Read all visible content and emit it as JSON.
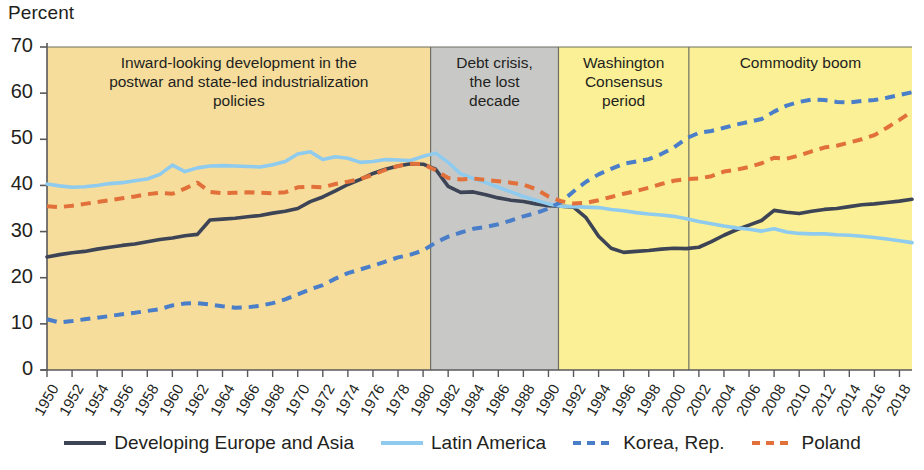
{
  "chart_data": {
    "type": "line",
    "title": "",
    "ylabel": "Percent",
    "xlabel": "",
    "ylim": [
      0,
      70
    ],
    "ytick_step": 10,
    "yticks": [
      0,
      10,
      20,
      30,
      40,
      50,
      60,
      70
    ],
    "xlim": [
      1950,
      2019
    ],
    "xticks": [
      1950,
      1952,
      1954,
      1956,
      1958,
      1960,
      1962,
      1964,
      1966,
      1968,
      1970,
      1972,
      1974,
      1976,
      1978,
      1980,
      1982,
      1984,
      1986,
      1988,
      1990,
      1992,
      1994,
      1996,
      1998,
      2000,
      2002,
      2004,
      2006,
      2008,
      2010,
      2012,
      2014,
      2016,
      2018
    ],
    "grid": false,
    "legend_position": "bottom",
    "x": [
      1950,
      1951,
      1952,
      1953,
      1954,
      1955,
      1956,
      1957,
      1958,
      1959,
      1960,
      1961,
      1962,
      1963,
      1964,
      1965,
      1966,
      1967,
      1968,
      1969,
      1970,
      1971,
      1972,
      1973,
      1974,
      1975,
      1976,
      1977,
      1978,
      1979,
      1980,
      1981,
      1982,
      1983,
      1984,
      1985,
      1986,
      1987,
      1988,
      1989,
      1990,
      1991,
      1992,
      1993,
      1994,
      1995,
      1996,
      1997,
      1998,
      1999,
      2000,
      2001,
      2002,
      2003,
      2004,
      2005,
      2006,
      2007,
      2008,
      2009,
      2010,
      2011,
      2012,
      2013,
      2014,
      2015,
      2016,
      2017,
      2018,
      2019
    ],
    "series": [
      {
        "name": "Developing Europe and Asia",
        "color": "#3c4455",
        "style": "solid",
        "values": [
          24.5,
          25.0,
          25.4,
          25.7,
          26.2,
          26.6,
          27.0,
          27.3,
          27.8,
          28.3,
          28.6,
          29.1,
          29.4,
          32.5,
          32.7,
          32.9,
          33.2,
          33.5,
          34.0,
          34.4,
          35.0,
          36.5,
          37.5,
          38.8,
          40.2,
          41.3,
          42.6,
          43.5,
          44.2,
          44.7,
          44.6,
          43.5,
          39.8,
          38.5,
          38.6,
          38.0,
          37.3,
          36.8,
          36.5,
          36.0,
          35.6,
          35.5,
          35.3,
          33.0,
          29.0,
          26.4,
          25.5,
          25.7,
          25.9,
          26.2,
          26.4,
          26.3,
          26.6,
          27.8,
          29.2,
          30.4,
          31.4,
          32.4,
          34.6,
          34.2,
          33.9,
          34.4,
          34.8,
          35.0,
          35.4,
          35.8,
          36.0,
          36.3,
          36.6,
          37.0
        ]
      },
      {
        "name": "Latin America",
        "color": "#8fcbee",
        "style": "solid",
        "values": [
          40.3,
          39.9,
          39.6,
          39.7,
          40.0,
          40.4,
          40.6,
          41.0,
          41.4,
          42.4,
          44.4,
          43.0,
          43.8,
          44.2,
          44.3,
          44.2,
          44.1,
          44.0,
          44.5,
          45.2,
          46.8,
          47.3,
          45.6,
          46.2,
          45.9,
          45.0,
          45.2,
          45.6,
          45.5,
          45.4,
          46.3,
          47.0,
          45.0,
          42.5,
          41.5,
          40.6,
          39.6,
          38.6,
          37.6,
          36.8,
          36.0,
          35.5,
          35.4,
          35.3,
          35.2,
          34.8,
          34.5,
          34.1,
          33.8,
          33.6,
          33.3,
          32.8,
          32.2,
          31.7,
          31.2,
          30.8,
          30.5,
          30.1,
          30.6,
          29.9,
          29.6,
          29.5,
          29.5,
          29.3,
          29.2,
          29.0,
          28.7,
          28.4,
          28.0,
          27.6
        ]
      },
      {
        "name": "Korea, Rep.",
        "color": "#4a7ec8",
        "style": "dashed",
        "values": [
          11.0,
          10.3,
          10.6,
          11.0,
          11.3,
          11.7,
          12.1,
          12.4,
          12.8,
          13.2,
          14.0,
          14.4,
          14.5,
          14.2,
          13.8,
          13.5,
          13.6,
          13.9,
          14.5,
          15.3,
          16.4,
          17.5,
          18.4,
          19.8,
          21.0,
          21.8,
          22.6,
          23.5,
          24.4,
          25.0,
          25.9,
          27.6,
          28.9,
          29.8,
          30.6,
          31.0,
          31.6,
          32.4,
          33.3,
          34.0,
          35.0,
          36.4,
          38.7,
          40.8,
          42.4,
          43.6,
          44.7,
          45.2,
          45.7,
          46.8,
          48.2,
          50.2,
          51.4,
          51.8,
          52.5,
          53.2,
          53.8,
          54.4,
          56.0,
          57.3,
          58.1,
          58.6,
          58.5,
          58.1,
          58.0,
          58.3,
          58.5,
          59.0,
          59.6,
          60.2
        ]
      },
      {
        "name": "Poland",
        "color": "#e2703a",
        "style": "dashed",
        "values": [
          35.5,
          35.3,
          35.6,
          36.0,
          36.4,
          36.8,
          37.2,
          37.6,
          38.1,
          38.4,
          38.2,
          39.3,
          40.6,
          38.6,
          38.3,
          38.4,
          38.5,
          38.4,
          38.3,
          38.5,
          39.6,
          39.7,
          39.6,
          40.3,
          40.8,
          41.4,
          42.3,
          43.4,
          44.2,
          44.7,
          44.6,
          43.3,
          41.6,
          41.3,
          41.5,
          41.2,
          40.9,
          40.6,
          40.2,
          39.2,
          37.6,
          36.6,
          36.1,
          36.2,
          36.8,
          37.5,
          38.2,
          38.8,
          39.5,
          40.3,
          41.0,
          41.4,
          41.5,
          42.0,
          43.0,
          43.4,
          44.0,
          44.8,
          46.0,
          45.8,
          46.5,
          47.4,
          48.2,
          48.6,
          49.3,
          50.0,
          50.9,
          52.5,
          54.2,
          56.0
        ]
      }
    ],
    "bands": [
      {
        "id": "inward-looking",
        "label": "Inward-looking development in the postwar and state-led industrialization policies",
        "label_lines": [
          "Inward-looking development in the",
          "postwar and state-led industrialization",
          "policies"
        ],
        "start": 1950,
        "end": 1980.6,
        "color": "#f6dd9b"
      },
      {
        "id": "debt-crisis",
        "label": "Debt crisis, the lost decade",
        "label_lines": [
          "Debt crisis,",
          "the lost",
          "decade"
        ],
        "start": 1980.6,
        "end": 1990.8,
        "color": "#c8c9c7"
      },
      {
        "id": "washington-consensus",
        "label": "Washington Consensus period",
        "label_lines": [
          "Washington",
          "Consensus",
          "period"
        ],
        "start": 1990.8,
        "end": 2001.2,
        "color": "#fbf095"
      },
      {
        "id": "commodity-boom",
        "label": "Commodity boom",
        "label_lines": [
          "Commodity boom"
        ],
        "start": 2001.2,
        "end": 2019,
        "color": "#fbf095"
      }
    ]
  },
  "legend": {
    "items": [
      {
        "label": "Developing Europe and Asia",
        "color": "#3c4455",
        "style": "solid"
      },
      {
        "label": "Latin America",
        "color": "#8fcbee",
        "style": "solid"
      },
      {
        "label": "Korea, Rep.",
        "color": "#4a7ec8",
        "style": "dashed"
      },
      {
        "label": "Poland",
        "color": "#e2703a",
        "style": "dashed"
      }
    ]
  }
}
